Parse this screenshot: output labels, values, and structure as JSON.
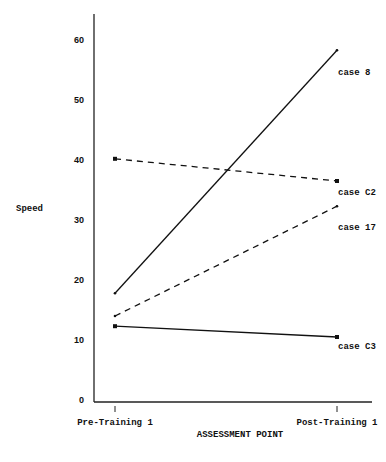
{
  "chart_data": {
    "type": "line",
    "title": "",
    "xlabel": "ASSESSMENT POINT",
    "ylabel": "Speed",
    "categories": [
      "Pre-Training 1",
      "Post-Training 1"
    ],
    "ylim": [
      0,
      60
    ],
    "yticks": [
      0,
      10,
      20,
      30,
      40,
      50,
      60
    ],
    "grid": false,
    "legend_position": "inline-right",
    "series": [
      {
        "name": "case 8",
        "values": [
          17.8,
          58.3
        ],
        "style": "solid",
        "marker": "dot"
      },
      {
        "name": "case C2",
        "values": [
          40.2,
          36.5
        ],
        "style": "dashed",
        "marker": "square"
      },
      {
        "name": "case 17",
        "values": [
          14.0,
          32.3
        ],
        "style": "dashed",
        "marker": "dot"
      },
      {
        "name": "case C3",
        "values": [
          12.3,
          10.5
        ],
        "style": "solid",
        "marker": "square"
      }
    ]
  }
}
